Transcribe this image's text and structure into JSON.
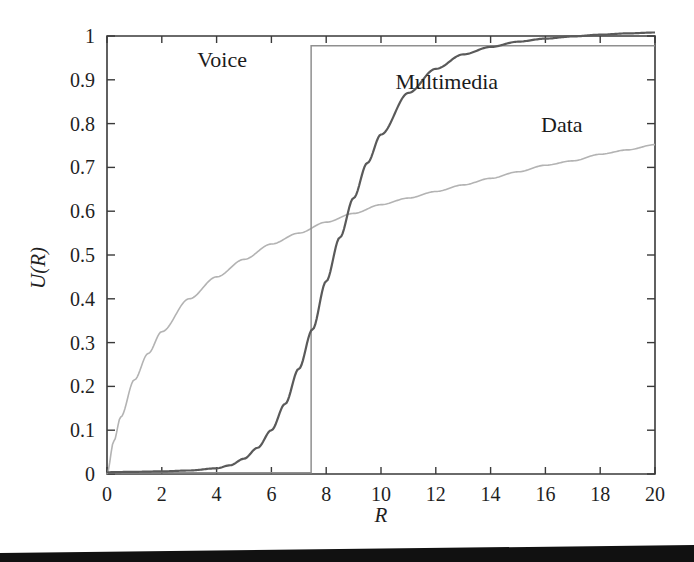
{
  "figure": {
    "background_color": "#ffffff",
    "scan_edge_color": "#111111"
  },
  "chart_data": {
    "type": "line",
    "title": "",
    "subtitle": "",
    "xlabel": "R",
    "ylabel": "U(R)",
    "xlim": [
      0,
      20
    ],
    "ylim": [
      0,
      1
    ],
    "grid": false,
    "legend_position": "inline-annotations",
    "xticks": [
      0,
      2,
      4,
      6,
      8,
      10,
      12,
      14,
      16,
      18,
      20
    ],
    "xtick_labels": [
      "0",
      "2",
      "4",
      "6",
      "8",
      "10",
      "12",
      "14",
      "16",
      "18",
      "20"
    ],
    "yticks": [
      0,
      0.1,
      0.2,
      0.3,
      0.4,
      0.5,
      0.6,
      0.7,
      0.8,
      0.9,
      1
    ],
    "ytick_labels": [
      "0",
      "0.1",
      "0.2",
      "0.3",
      "0.4",
      "0.5",
      "0.6",
      "0.7",
      "0.8",
      "0.9",
      "1"
    ],
    "annotations": [
      {
        "text": "Voice",
        "x": 4.2,
        "y": 0.93
      },
      {
        "text": "Multimedia",
        "x": 12.4,
        "y": 0.88
      },
      {
        "text": "Data",
        "x": 16.6,
        "y": 0.78
      }
    ],
    "series": [
      {
        "name": "Voice",
        "color": "#8f8f8f",
        "style": "step",
        "step_x": 7.45,
        "low_value": 0.003,
        "high_value": 0.978,
        "x": [
          0,
          7.45,
          7.45,
          20
        ],
        "values": [
          0.003,
          0.003,
          0.978,
          0.978
        ]
      },
      {
        "name": "Multimedia",
        "color": "#5a5a5a",
        "style": "sigmoid",
        "x": [
          0,
          1,
          2,
          3,
          4,
          4.5,
          5,
          5.5,
          6,
          6.5,
          7,
          7.5,
          8,
          8.5,
          9,
          9.5,
          10,
          11,
          12,
          13,
          14,
          15,
          16,
          17,
          18,
          19,
          20
        ],
        "values": [
          0.004,
          0.005,
          0.006,
          0.008,
          0.013,
          0.02,
          0.035,
          0.06,
          0.1,
          0.16,
          0.24,
          0.33,
          0.44,
          0.54,
          0.63,
          0.71,
          0.775,
          0.87,
          0.925,
          0.958,
          0.975,
          0.987,
          0.994,
          0.999,
          1.003,
          1.006,
          1.008
        ]
      },
      {
        "name": "Data",
        "color": "#b3b3b3",
        "style": "logarithmic",
        "x": [
          0,
          0.25,
          0.5,
          1,
          1.5,
          2,
          3,
          4,
          5,
          6,
          7,
          8,
          9,
          10,
          11,
          12,
          13,
          14,
          15,
          16,
          17,
          18,
          19,
          20
        ],
        "values": [
          0.0,
          0.075,
          0.13,
          0.215,
          0.275,
          0.325,
          0.4,
          0.45,
          0.49,
          0.525,
          0.55,
          0.575,
          0.595,
          0.615,
          0.63,
          0.645,
          0.66,
          0.675,
          0.69,
          0.705,
          0.715,
          0.73,
          0.74,
          0.752
        ]
      }
    ]
  }
}
